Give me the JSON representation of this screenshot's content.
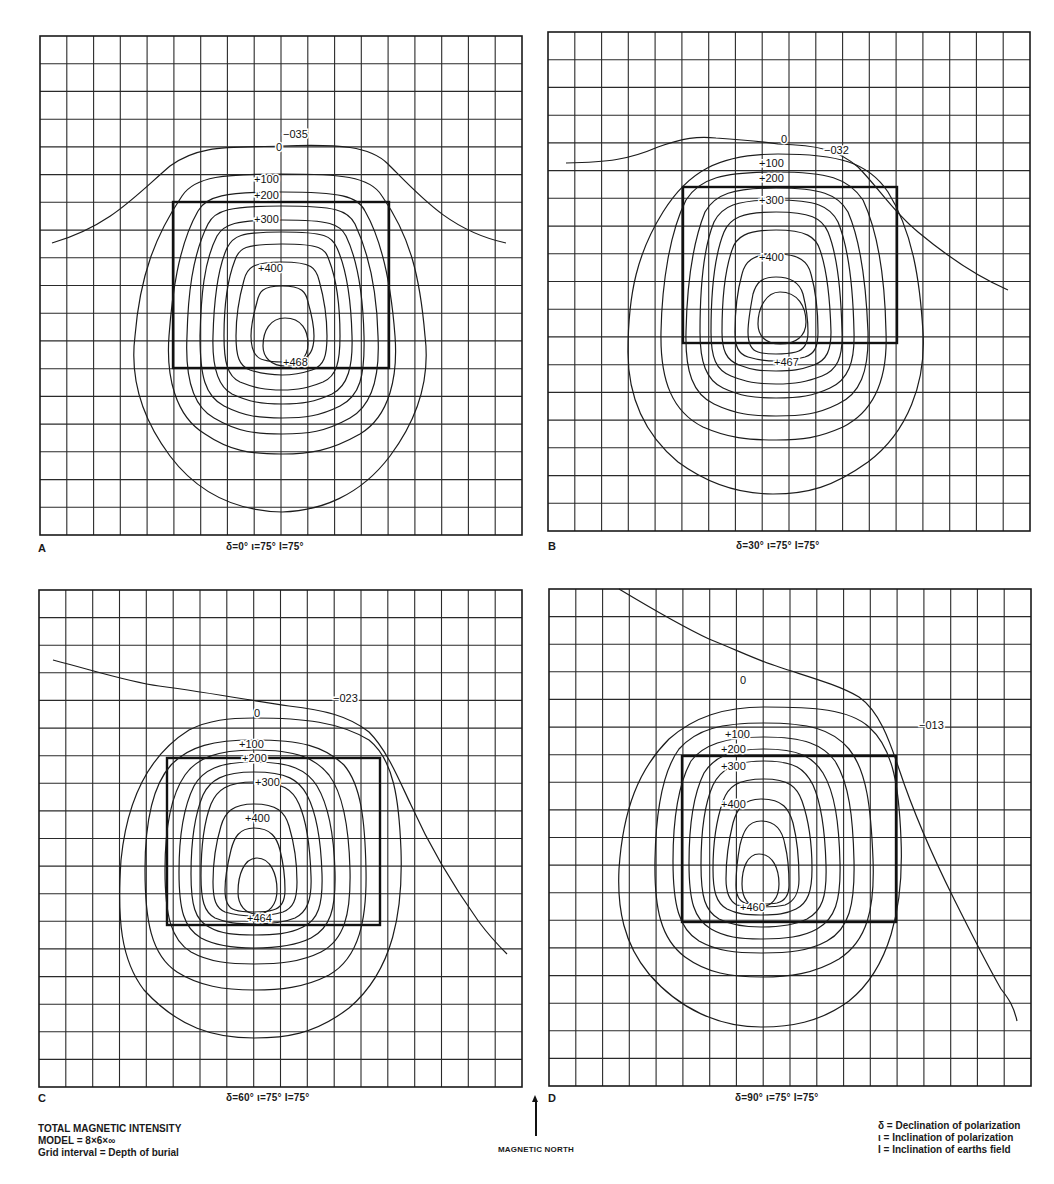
{
  "figure": {
    "legend_left": {
      "title": "TOTAL MAGNETIC INTENSITY",
      "model": "MODEL = 8×6×∞",
      "grid": "Grid interval = Depth of burial"
    },
    "legend_right": {
      "delta": "δ = Declination of polarization",
      "iota": "ι = Inclination of polarization",
      "I": "I = Inclination of earths field"
    },
    "north_label": "MAGNETIC NORTH",
    "caption": ""
  },
  "panels": [
    {
      "id": "A",
      "label": "A",
      "params": "δ=0°   ι=75°   I=75°",
      "min_label": "−035",
      "max_label": "+468",
      "contour_labels": [
        "0",
        "+100",
        "+200",
        "+300",
        "+400"
      ]
    },
    {
      "id": "B",
      "label": "B",
      "params": "δ=30°  ι=75°   I=75°",
      "min_label": "−032",
      "max_label": "+467",
      "contour_labels": [
        "0",
        "+100",
        "+200",
        "+300",
        "+400"
      ]
    },
    {
      "id": "C",
      "label": "C",
      "params": "δ=60°  ι=75°   I=75°",
      "min_label": "−023",
      "max_label": "+464",
      "contour_labels": [
        "0",
        "+100",
        "+200",
        "+300",
        "+400"
      ]
    },
    {
      "id": "D",
      "label": "D",
      "params": "δ=90°  ι=75°   I=75°",
      "min_label": "−013",
      "max_label": "+460",
      "contour_labels": [
        "0",
        "+100",
        "+200",
        "+300",
        "+400"
      ]
    }
  ],
  "chart_data": {
    "type": "contour",
    "grid": {
      "columns": 18,
      "rows": 18,
      "interval": "depth of burial"
    },
    "contour_interval": 50,
    "labeled_levels": [
      0,
      100,
      200,
      300,
      400
    ],
    "panels": [
      {
        "panel": "A",
        "declination_deg": 0,
        "inclination_polarization_deg": 75,
        "inclination_field_deg": 75,
        "max": 468,
        "min": -35
      },
      {
        "panel": "B",
        "declination_deg": 30,
        "inclination_polarization_deg": 75,
        "inclination_field_deg": 75,
        "max": 467,
        "min": -32
      },
      {
        "panel": "C",
        "declination_deg": 60,
        "inclination_polarization_deg": 75,
        "inclination_field_deg": 75,
        "max": 464,
        "min": -23
      },
      {
        "panel": "D",
        "declination_deg": 90,
        "inclination_polarization_deg": 75,
        "inclination_field_deg": 75,
        "max": 460,
        "min": -13
      }
    ]
  }
}
